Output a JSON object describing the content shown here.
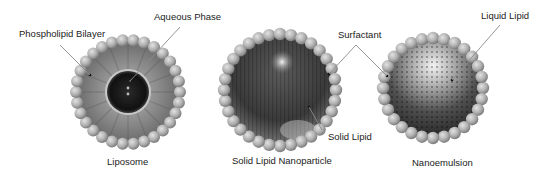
{
  "figure": {
    "particles": [
      {
        "id": "liposome",
        "caption": "Liposome"
      },
      {
        "id": "sln",
        "caption": "Solid Lipid Nanoparticle"
      },
      {
        "id": "nanoemulsion",
        "caption": "Nanoemulsion"
      }
    ],
    "labels": {
      "phospholipid_bilayer": "Phospholipid Bilayer",
      "aqueous_phase": "Aqueous Phase",
      "surfactant": "Surfactant",
      "solid_lipid": "Solid Lipid",
      "liquid_lipid": "Liquid Lipid"
    },
    "colors": {
      "bead": "#b4b4b4",
      "bead_highlight": "#dcdcdc",
      "bead_shadow": "#7a7a7a",
      "liposome_core": "#1a1a1a",
      "shell_inner": "#6e6e6e",
      "sln_core": "#3c3c3c",
      "ne_core": "#4a4a4a",
      "leader": "#8a8a8a",
      "text": "#222222"
    }
  }
}
